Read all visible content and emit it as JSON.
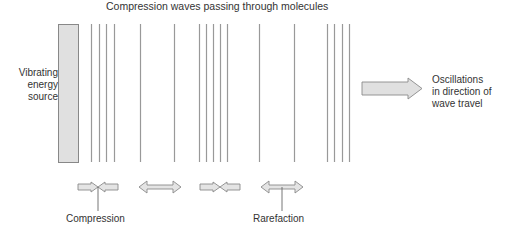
{
  "title": "Compression waves passing through molecules",
  "source": {
    "label_lines": [
      "Vibrating",
      "energy",
      "source"
    ],
    "fill": "#e0e0e0",
    "stroke": "#888888"
  },
  "direction": {
    "label_lines": [
      "Oscillations",
      "in direction of",
      "wave travel"
    ]
  },
  "labels": {
    "compression": "Compression",
    "rarefaction": "Rarefaction"
  },
  "wave_lines_x": [
    91,
    99,
    106,
    114,
    140,
    174,
    199,
    206,
    213,
    220,
    227,
    259,
    294,
    327,
    334,
    342,
    349
  ],
  "arrow_pairs": [
    {
      "type": "compression",
      "center_x": 98
    },
    {
      "type": "rarefaction",
      "center_x": 160
    },
    {
      "type": "compression",
      "center_x": 220
    },
    {
      "type": "rarefaction",
      "center_x": 282
    }
  ],
  "colors": {
    "line": "#999999",
    "arrow_fill": "#e4e4e4",
    "arrow_stroke": "#8a8a8a",
    "text": "#333333"
  }
}
